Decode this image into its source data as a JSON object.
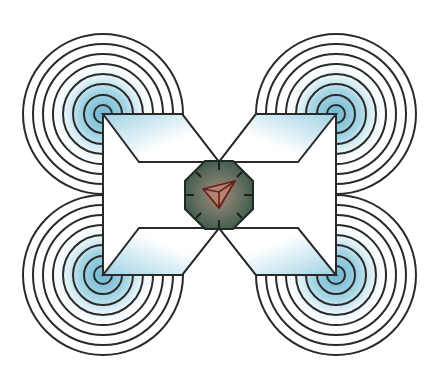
{
  "diagram": {
    "title": "",
    "colors": {
      "background": "#ffffff",
      "stroke": "#2a2a2a",
      "rotor_glow": "#7fc3d8",
      "arm_tint": "#a9d8e8",
      "hub_fill_center": "#a08a78",
      "hub_fill_edge": "#3f5a4c",
      "arrow_stroke": "#6b1e1a",
      "arrow_fill": "#c77a6a"
    },
    "rotors": [
      {
        "name": "rotor-top-left",
        "cx": 103,
        "cy": 114
      },
      {
        "name": "rotor-top-right",
        "cx": 336,
        "cy": 114
      },
      {
        "name": "rotor-bottom-left",
        "cx": 103,
        "cy": 275
      },
      {
        "name": "rotor-bottom-right",
        "cx": 336,
        "cy": 275
      }
    ],
    "rotor_ring_radii": [
      9,
      19,
      30,
      40,
      50,
      60,
      70,
      80
    ],
    "hub": {
      "cx": 219,
      "cy": 195,
      "r": 35,
      "ticks": 8
    },
    "heading_arrow": {
      "direction": "north-east"
    }
  }
}
